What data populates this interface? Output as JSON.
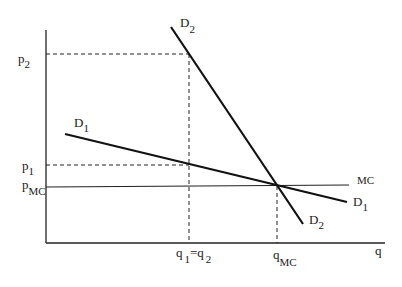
{
  "diagram": {
    "type": "economics-demand-supply",
    "axes": {
      "x_label": "q",
      "y_label": ""
    },
    "price_labels": [
      {
        "base": "p",
        "sub": "2"
      },
      {
        "base": "p",
        "sub": "1"
      },
      {
        "base": "p",
        "sub": "MC"
      }
    ],
    "quantity_labels": [
      {
        "text": "q",
        "sub1": "1",
        "eq": "=",
        "text2": "q",
        "sub2": "2"
      },
      {
        "base": "q",
        "sub": "MC"
      }
    ],
    "curves": [
      {
        "name": "D",
        "sub": "1",
        "label_positions": [
          "top-left",
          "right-end"
        ]
      },
      {
        "name": "D",
        "sub": "2",
        "label_positions": [
          "top",
          "bottom-end"
        ]
      },
      {
        "name": "MC",
        "sub": ""
      }
    ]
  },
  "labels": {
    "p2_base": "p",
    "p2_sub": "2",
    "p1_base": "p",
    "p1_sub": "1",
    "pmc_base": "p",
    "pmc_sub": "MC",
    "q12_q1": "q",
    "q12_sub1": "1",
    "q12_eq": "=",
    "q12_q2": "q",
    "q12_sub2": "2",
    "qmc_base": "q",
    "qmc_sub": "MC",
    "q_axis": "q",
    "mc": "MC",
    "d1_base": "D",
    "d1_sub": "1",
    "d2_base": "D",
    "d2_sub": "2"
  }
}
